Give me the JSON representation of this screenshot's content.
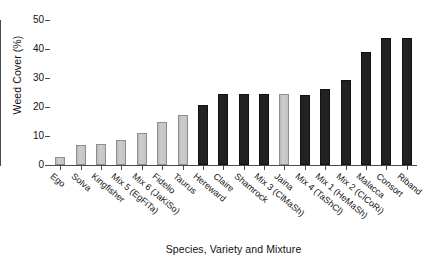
{
  "chart_data": {
    "type": "bar",
    "title": "",
    "xlabel": "Species, Variety and Mixture",
    "ylabel": "Weed Cover (%)",
    "ylim": [
      0,
      50
    ],
    "yticks": [
      0,
      10,
      20,
      30,
      40,
      50
    ],
    "grid": false,
    "legend": "none",
    "categories": [
      "Ego",
      "Solva",
      "Kingfisher",
      "Mix 5 (EgFiTa)",
      "Mix 6 (JaKiSo)",
      "Fidelio",
      "Taurus",
      "Hereward",
      "Claire",
      "Shamrock",
      "Mix 3 (ClMaSh)",
      "Jaina",
      "Mix 4 (TaShCl)",
      "Mix 1 (HeMaSh)",
      "Mix 2 (ClCoRi)",
      "Malacca",
      "Consort",
      "Riband"
    ],
    "values": [
      2.6,
      6.8,
      7.2,
      8.7,
      11.2,
      14.8,
      17.2,
      20.8,
      24.5,
      24.5,
      24.5,
      24.5,
      24.2,
      26.2,
      29.2,
      38.8,
      43.7,
      43.7
    ],
    "bar_colors": [
      "light",
      "light",
      "light",
      "light",
      "light",
      "light",
      "light",
      "dark",
      "dark",
      "dark",
      "dark",
      "light",
      "dark",
      "dark",
      "dark",
      "dark",
      "dark",
      "dark"
    ],
    "colors": {
      "light_fill": "#c9c9c9",
      "light_edge": "#8e8e8e",
      "dark_fill": "#222222",
      "dark_edge": "#111111",
      "axis": "#4a4a4a",
      "text": "#111111",
      "background": "#ffffff"
    }
  }
}
